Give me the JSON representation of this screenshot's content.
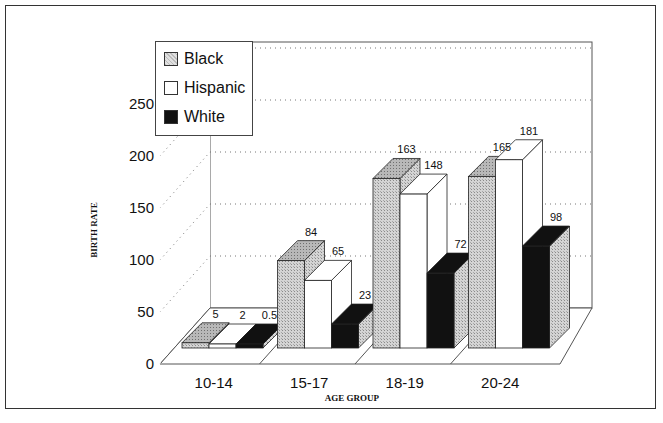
{
  "chart_data": {
    "type": "bar",
    "title": "",
    "xlabel": "AGE GROUP",
    "ylabel": "BIRTH RATE",
    "ylim": [
      0,
      250
    ],
    "yticks": [
      0,
      50,
      100,
      150,
      200,
      250
    ],
    "grid": true,
    "style": "3d-clustered-bar",
    "legend_position": "top-left",
    "categories": [
      "10-14",
      "15-17",
      "18-19",
      "20-24"
    ],
    "series": [
      {
        "name": "Black",
        "values": [
          5,
          84,
          163,
          165
        ],
        "fill": "hatched-gray"
      },
      {
        "name": "Hispanic",
        "values": [
          2,
          65,
          148,
          181
        ],
        "fill": "white"
      },
      {
        "name": "White",
        "values": [
          0.5,
          23,
          72,
          98
        ],
        "fill": "black"
      }
    ],
    "value_labels": [
      [
        "5",
        "84",
        "163",
        "165"
      ],
      [
        "2",
        "65",
        "148",
        "181"
      ],
      [
        "0.5",
        "23",
        "72",
        "98"
      ]
    ]
  },
  "legend": {
    "items": [
      {
        "label": "Black",
        "color": "#c8c8c8"
      },
      {
        "label": "Hispanic",
        "color": "#ffffff"
      },
      {
        "label": "White",
        "color": "#111111"
      }
    ]
  },
  "axes": {
    "y_title": "BIRTH RATE",
    "x_title": "AGE GROUP",
    "y_ticks": [
      "0",
      "50",
      "100",
      "150",
      "200",
      "250"
    ],
    "x_ticks": [
      "10-14",
      "15-17",
      "18-19",
      "20-24"
    ]
  }
}
